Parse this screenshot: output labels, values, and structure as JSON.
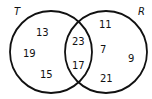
{
  "diagram": {
    "type": "venn",
    "sets": [
      {
        "label": "T",
        "color": "#111111"
      },
      {
        "label": "R",
        "color": "#111111"
      }
    ],
    "regions": {
      "t_only": [
        "13",
        "19",
        "15"
      ],
      "intersection": [
        "23",
        "17"
      ],
      "r_only": [
        "11",
        "7",
        "9",
        "21"
      ]
    }
  }
}
